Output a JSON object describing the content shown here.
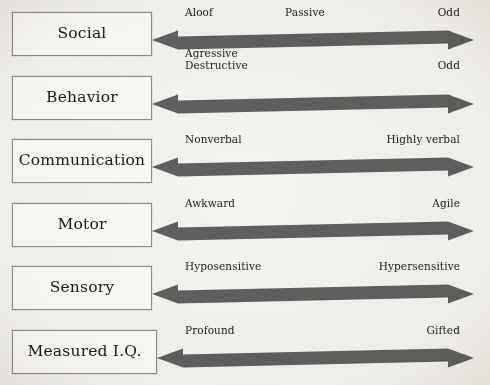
{
  "diagram": {
    "background_color": "#f4f3ef",
    "arrow_color": "#5f5f5f",
    "box_border_color": "#8d8d8d",
    "text_color": "#1c1c1c",
    "rows": [
      {
        "id": "social",
        "category": "Social",
        "left_label": "Aloof",
        "middle_label": "Passive",
        "right_label": "Odd"
      },
      {
        "id": "behavior",
        "category": "Behavior",
        "left_label": "Agressive\nDestructive",
        "middle_label": "",
        "right_label": "Odd"
      },
      {
        "id": "communication",
        "category": "Communication",
        "left_label": "Nonverbal",
        "middle_label": "",
        "right_label": "Highly verbal"
      },
      {
        "id": "motor",
        "category": "Motor",
        "left_label": "Awkward",
        "middle_label": "",
        "right_label": "Agile"
      },
      {
        "id": "sensory",
        "category": "Sensory",
        "left_label": "Hyposensitive",
        "middle_label": "",
        "right_label": "Hypersensitive"
      },
      {
        "id": "measured-iq",
        "category": "Measured I.Q.",
        "left_label": "Profound",
        "middle_label": "",
        "right_label": "Gifted"
      }
    ]
  },
  "layout": {
    "rows": [
      {
        "box_top": 12,
        "box_height": 44,
        "box_width": 140,
        "arrow_top": 27,
        "arrow_left": 152,
        "arrow_width": 322,
        "pole_top": 7,
        "pole_left": 185,
        "pole_right_edge": 460,
        "middle_center": 305
      },
      {
        "box_top": 76,
        "box_height": 44,
        "box_width": 140,
        "arrow_top": 91,
        "arrow_left": 152,
        "arrow_width": 322,
        "pole_top": 60,
        "pole_left": 185,
        "pole_right_edge": 460,
        "middle_center": 305
      },
      {
        "box_top": 139,
        "box_height": 44,
        "box_width": 140,
        "arrow_top": 154,
        "arrow_left": 152,
        "arrow_width": 322,
        "pole_top": 134,
        "pole_left": 185,
        "pole_right_edge": 460,
        "middle_center": 305
      },
      {
        "box_top": 203,
        "box_height": 44,
        "box_width": 140,
        "arrow_top": 218,
        "arrow_left": 152,
        "arrow_width": 322,
        "pole_top": 198,
        "pole_left": 185,
        "pole_right_edge": 460,
        "middle_center": 305
      },
      {
        "box_top": 266,
        "box_height": 44,
        "box_width": 140,
        "arrow_top": 281,
        "arrow_left": 152,
        "arrow_width": 322,
        "pole_top": 261,
        "pole_left": 185,
        "pole_right_edge": 460,
        "middle_center": 305
      },
      {
        "box_top": 330,
        "box_height": 44,
        "box_width": 145,
        "arrow_top": 345,
        "arrow_left": 157,
        "arrow_width": 317,
        "pole_top": 325,
        "pole_left": 185,
        "pole_right_edge": 460,
        "middle_center": 305
      }
    ]
  }
}
